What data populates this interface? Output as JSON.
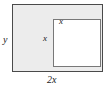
{
  "figure": {
    "type": "geometry-diagram",
    "outer_rect": {
      "name": "outer-rectangle",
      "fill_color": "#ececec",
      "border_color": "#4a4a4a",
      "width_label": "2x",
      "height_label": "y"
    },
    "inner_rect": {
      "name": "inner-square",
      "fill_color": "#ffffff",
      "border_color": "#787878",
      "top_label": "x",
      "left_label": "x"
    },
    "labels": {
      "left_side": "y",
      "bottom_side": "2x",
      "inner_top": "x",
      "inner_left": "x"
    }
  }
}
